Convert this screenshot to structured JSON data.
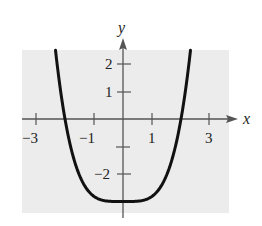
{
  "chart_data": {
    "type": "line",
    "title": "",
    "xlabel": "x",
    "ylabel": "y",
    "function": "y = (3/16)x^4 - 3",
    "xlim": [
      -3.5,
      3.7
    ],
    "ylim": [
      -3.4,
      2.5
    ],
    "x_ticks": [
      -3,
      -2,
      -1,
      1,
      2,
      3
    ],
    "x_tick_labels": [
      "-3",
      "-1",
      "1",
      "3"
    ],
    "x_labeled_values": [
      -3,
      -1,
      1,
      3
    ],
    "y_ticks": [
      -2,
      -1,
      1,
      2
    ],
    "y_tick_labels": [
      "-2",
      "1",
      "2"
    ],
    "y_labeled_values": [
      -2,
      1,
      2
    ],
    "grid": false,
    "background_color": "#ececec",
    "curve_color": "#111111",
    "series": [
      {
        "name": "curve",
        "x": [
          -2.33,
          -2,
          -1.5,
          -1,
          -0.5,
          0,
          0.5,
          1,
          1.5,
          2,
          2.33
        ],
        "y": [
          2.5,
          0,
          -2.05,
          -2.81,
          -2.99,
          -3,
          -2.99,
          -2.81,
          -2.05,
          0,
          2.5
        ]
      }
    ]
  },
  "labels": {
    "x_axis": "x",
    "y_axis": "y",
    "xt_m3": "−3",
    "xt_m1": "−1",
    "xt_1": "1",
    "xt_3": "3",
    "yt_2": "2",
    "yt_1": "1",
    "yt_m2": "−2"
  }
}
